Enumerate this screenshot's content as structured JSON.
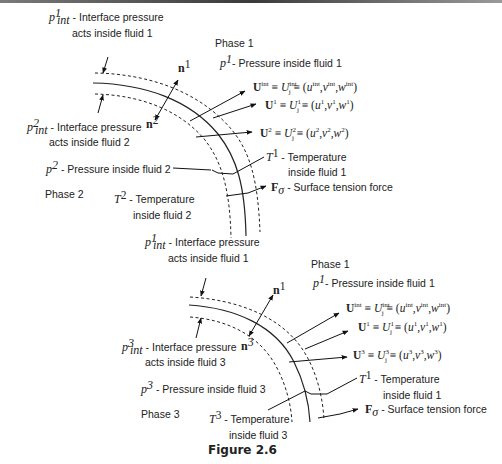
{
  "caption": "Figure 2.6",
  "diagrams": [
    {
      "id": "top",
      "phase_outer": "Phase 1",
      "phase_inner": "Phase 2",
      "labels": {
        "p_int_outer_sym": "p",
        "p_int_outer_sup": "1",
        "p_int_outer_sub": "int",
        "p_int_outer_line1": " - Interface pressure",
        "p_int_outer_line2": "acts inside fluid 1",
        "p_int_inner_sym": "p",
        "p_int_inner_sup": "2",
        "p_int_inner_sub": "int",
        "p_int_inner_line1": " - Interface pressure",
        "p_int_inner_line2": "acts inside fluid 2",
        "p_outer_sym": "p",
        "p_outer_sup": "1",
        "p_outer_text": "- Pressure inside fluid 1",
        "p_inner_sym": "p",
        "p_inner_sup": "2",
        "p_inner_text": " - Pressure inside fluid 2",
        "n_outer": "n",
        "n_outer_sup": "1",
        "n_inner": "n",
        "n_inner_sup": "2",
        "U_int": "U",
        "U_int_sup": "int",
        "U_int_eq": " ≡ U",
        "U_int_j_sup": "int",
        "U_int_j_sub": "j",
        "U_int_tuple": " ≡ (u^int, v^int, w^int)",
        "U_int_u": "u",
        "U_int_v": "v",
        "U_int_w": "w",
        "U_outer_sup": "1",
        "U_inner_sup": "2",
        "T_outer_sym": "T",
        "T_outer_sup": "1",
        "T_outer_line1": " - Temperature",
        "T_outer_line2": "inside fluid 1",
        "T_inner_sym": "T",
        "T_inner_sup": "2",
        "T_inner_line1": " - Temperature",
        "T_inner_line2": "inside fluid 2",
        "F_sym": "F",
        "F_sub": "σ",
        "F_text": " - Surface tension force"
      }
    },
    {
      "id": "bottom",
      "phase_outer": "Phase 1",
      "phase_inner": "Phase 3",
      "labels": {
        "p_int_outer_sup": "1",
        "p_int_outer_line1": " - Interface pressure",
        "p_int_outer_line2": "acts inside fluid 1",
        "p_int_inner_sup": "3",
        "p_int_inner_line1": " - Interface pressure",
        "p_int_inner_line2": "acts inside fluid 3",
        "p_outer_sup": "1",
        "p_outer_text": "- Pressure inside fluid 1",
        "p_inner_sup": "3",
        "p_inner_text": " - Pressure inside fluid 3",
        "n_outer_sup": "1",
        "n_inner_sup": "3",
        "U_outer_sup": "1",
        "U_inner_sup": "3",
        "T_outer_sup": "1",
        "T_outer_line1": " - Temperature",
        "T_outer_line2": "inside fluid 1",
        "T_inner_sup": "3",
        "T_inner_line1": " - Temperature",
        "T_inner_line2": "inside fluid 3",
        "F_text": " - Surface tension force"
      }
    }
  ],
  "common": {
    "p": "p",
    "int": "int",
    "n": "n",
    "U": "U",
    "Uj": "U",
    "j": "j",
    "eq": "≡",
    "u": "u",
    "v": "v",
    "w": "w",
    "T": "T",
    "F": "F",
    "sigma": "σ",
    "lparen": "(",
    "rparen": ")",
    "comma": ","
  }
}
